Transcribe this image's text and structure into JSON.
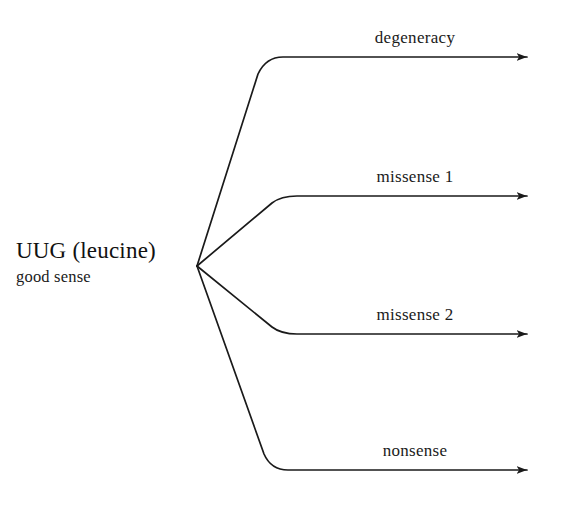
{
  "diagram": {
    "background_color": "#ffffff",
    "stroke_color": "#1a1a1a",
    "source": {
      "codon_label": "UUG (leucine)",
      "sense_label": "good sense",
      "fork_x": 197,
      "fork_y": 266
    },
    "branches": [
      {
        "id": "degeneracy",
        "label": "degeneracy",
        "arrow_y": 57,
        "corner_x": 283,
        "arrow_tip_x": 537
      },
      {
        "id": "missense-1",
        "label": "missense 1",
        "arrow_y": 196,
        "corner_x": 297,
        "arrow_tip_x": 537
      },
      {
        "id": "missense-2",
        "label": "missense 2",
        "arrow_y": 334,
        "corner_x": 297,
        "arrow_tip_x": 537
      },
      {
        "id": "nonsense",
        "label": "nonsense",
        "arrow_y": 470,
        "corner_x": 288,
        "arrow_tip_x": 537
      }
    ]
  }
}
